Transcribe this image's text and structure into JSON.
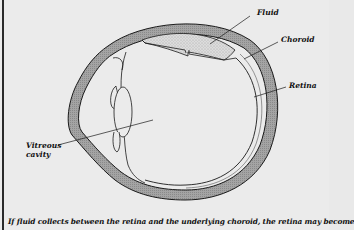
{
  "figure": {
    "labels": {
      "fluid": "Fluid",
      "choroid": "Choroid",
      "retina": "Retina",
      "vitreous_line1": "Vitreous",
      "vitreous_line2": "cavity"
    },
    "caption": "If fluid collects between the retina and the underlying choroid, the retina may become",
    "colors": {
      "background": "#ebebeb",
      "wall_fill": "#9a9a9a",
      "fluid_fill": "#d6d6d6",
      "outline": "#1a1a1a"
    }
  }
}
